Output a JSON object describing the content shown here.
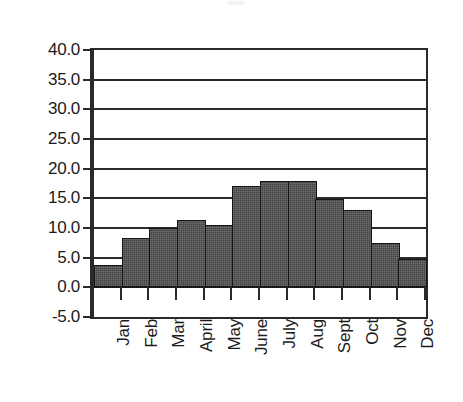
{
  "chart_data": {
    "type": "bar",
    "title": "",
    "xlabel": "",
    "ylabel": "",
    "categories": [
      "Jan",
      "Feb",
      "Mar",
      "April",
      "May",
      "June",
      "July",
      "Aug",
      "Sept",
      "Oct",
      "Nov",
      "Dec"
    ],
    "values": [
      3.8,
      8.3,
      10.0,
      11.3,
      10.5,
      17.0,
      18.0,
      18.0,
      14.9,
      13.1,
      7.5,
      4.8
    ],
    "ylim": [
      -5.0,
      40.0
    ],
    "ytick_values": [
      40.0,
      35.0,
      30.0,
      25.0,
      20.0,
      15.0,
      10.0,
      5.0,
      0.0,
      -5.0
    ],
    "ytick_labels": [
      "40.0",
      "35.0",
      "30.0",
      "25.0",
      "20.0",
      "15.0",
      "10.0",
      "5.0",
      "0.0",
      "-5.0"
    ],
    "grid": true,
    "grid_axis": "y",
    "legend": false,
    "legend_position": "none",
    "bar_gap": 0,
    "series": [
      {
        "name": "",
        "values": [
          3.8,
          8.3,
          10.0,
          11.3,
          10.5,
          17.0,
          18.0,
          18.0,
          14.9,
          13.1,
          7.5,
          4.8
        ]
      }
    ]
  },
  "style": {
    "bar_fill": "#4b4b4b",
    "bar_outline": "#141414",
    "axis_color": "#2a2a2a",
    "gridline_color": "#2a2a2a",
    "background": "#ffffff",
    "text_color": "#1b1b1b"
  }
}
